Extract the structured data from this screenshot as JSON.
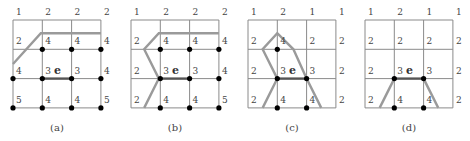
{
  "edge_label": "e",
  "panels": [
    {
      "id": "a",
      "caption": "(a)",
      "labels": [
        [
          "1",
          "2",
          "2",
          "2"
        ],
        [
          "2",
          "4",
          "4",
          "4"
        ],
        [
          "4",
          "3",
          "3",
          "4"
        ],
        [
          "5",
          "4",
          "4",
          "5"
        ]
      ],
      "nodes": [
        [
          1,
          1
        ],
        [
          1,
          2
        ],
        [
          1,
          3
        ],
        [
          2,
          0
        ],
        [
          2,
          1
        ],
        [
          2,
          2
        ],
        [
          2,
          3
        ],
        [
          3,
          0
        ],
        [
          3,
          1
        ],
        [
          3,
          2
        ],
        [
          3,
          3
        ]
      ],
      "path_segments": [
        [
          [
            0,
            1.5
          ],
          [
            0.95,
            0.45
          ],
          [
            3,
            0.45
          ]
        ]
      ]
    },
    {
      "id": "b",
      "caption": "(b)",
      "labels": [
        [
          "1",
          "2",
          "2",
          "2"
        ],
        [
          "2",
          "4",
          "4",
          "4"
        ],
        [
          "2",
          "3",
          "3",
          "4"
        ],
        [
          "2",
          "4",
          "4",
          "5"
        ]
      ],
      "nodes": [
        [
          1,
          1
        ],
        [
          1,
          2
        ],
        [
          1,
          3
        ],
        [
          2,
          1
        ],
        [
          2,
          2
        ],
        [
          2,
          3
        ],
        [
          3,
          1
        ],
        [
          3,
          2
        ],
        [
          3,
          3
        ]
      ],
      "path_segments": [
        [
          [
            3,
            0.45
          ],
          [
            0.95,
            0.45
          ],
          [
            0.45,
            1
          ],
          [
            0.95,
            2
          ],
          [
            0.45,
            3
          ]
        ]
      ]
    },
    {
      "id": "c",
      "caption": "(c)",
      "labels": [
        [
          "1",
          "2",
          "1",
          "1"
        ],
        [
          "2",
          "4",
          "2",
          "2"
        ],
        [
          "2",
          "3",
          "3",
          "2"
        ],
        [
          "2",
          "4",
          "4",
          "2"
        ]
      ],
      "nodes": [
        [
          1,
          1
        ],
        [
          2,
          1
        ],
        [
          2,
          2
        ],
        [
          3,
          1
        ],
        [
          3,
          2
        ]
      ],
      "path_segments": [
        [
          [
            0.5,
            3
          ],
          [
            1,
            2
          ],
          [
            0.5,
            1
          ],
          [
            1,
            0.45
          ],
          [
            1.55,
            1
          ],
          [
            2,
            2
          ],
          [
            2.5,
            3
          ]
        ]
      ]
    },
    {
      "id": "d",
      "caption": "(d)",
      "labels": [
        [
          "1",
          "2",
          "1",
          "1"
        ],
        [
          "2",
          "2",
          "2",
          "2"
        ],
        [
          "2",
          "3",
          "3",
          "2"
        ],
        [
          "2",
          "4",
          "4",
          "2"
        ]
      ],
      "nodes": [
        [
          2,
          1
        ],
        [
          2,
          2
        ],
        [
          3,
          1
        ],
        [
          3,
          2
        ]
      ],
      "path_segments": [
        [
          [
            0.5,
            3
          ],
          [
            1,
            2
          ]
        ],
        [
          [
            2,
            2
          ],
          [
            2.5,
            3
          ]
        ]
      ]
    }
  ]
}
